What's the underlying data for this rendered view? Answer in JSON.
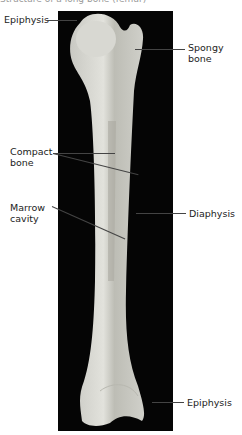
{
  "figure": {
    "caption_partial": "Structure of a long bone (femur)",
    "subject": "femur",
    "background_color": "#050505",
    "bone_color": "#d4d4cf"
  },
  "labels": {
    "epiphysis_top": "Epiphysis",
    "spongy_bone": "Spongy\nbone",
    "spongy_line1": "Spongy",
    "spongy_line2": "bone",
    "compact_line1": "Compact",
    "compact_line2": "bone",
    "marrow_line1": "Marrow",
    "marrow_line2": "cavity",
    "diaphysis": "Diaphysis",
    "epiphysis_bottom": "Epiphysis"
  }
}
